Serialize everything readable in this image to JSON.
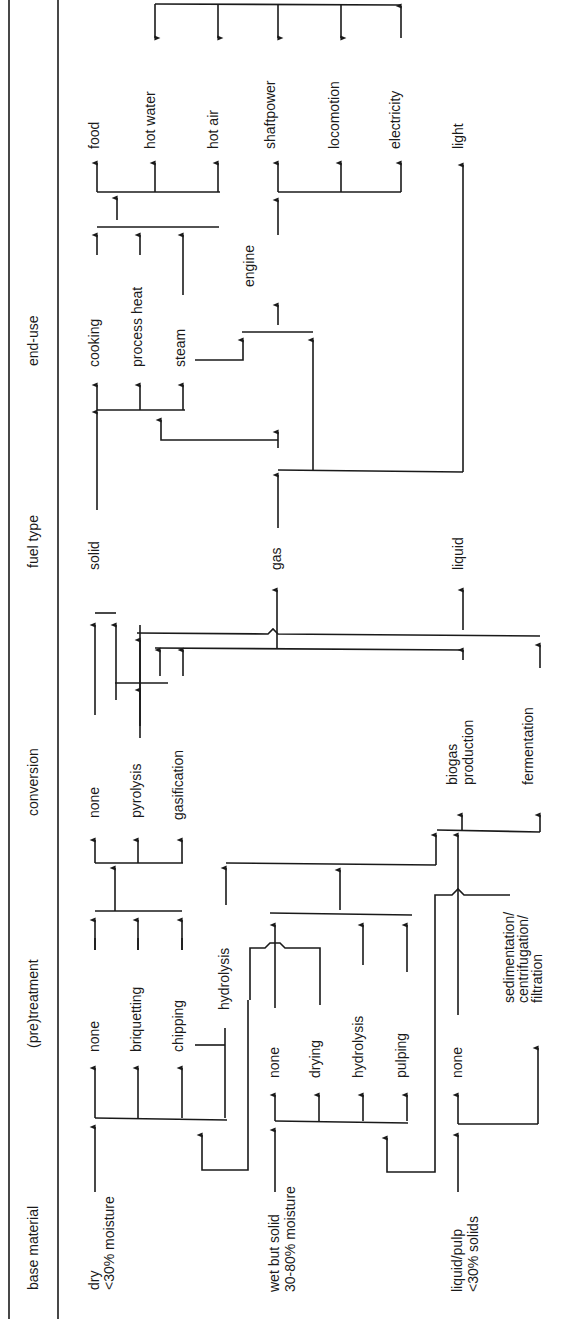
{
  "headers": {
    "base_material": "base material",
    "pretreatment": "(pre)treatment",
    "conversion": "conversion",
    "fuel_type": "fuel type",
    "end_use": "end-use"
  },
  "base_material": {
    "dry": "dry",
    "dry_sub": "<30% moisture",
    "wet": "wet but solid",
    "wet_sub": "30-80% moisture",
    "liquid": "liquid/pulp",
    "liquid_sub": "<30% solids"
  },
  "pretreatment": {
    "none1": "none",
    "briquetting": "briquetting",
    "chipping": "chipping",
    "hydrolysis1": "hydrolysis",
    "none2": "none",
    "drying": "drying",
    "hydrolysis2": "hydrolysis",
    "pulping": "pulping",
    "none3": "none",
    "sed1": "sedimentation/",
    "sed2": "centrifugation/",
    "sed3": "filtration"
  },
  "conversion": {
    "none": "none",
    "pyrolysis": "pyrolysis",
    "gasification": "gasification",
    "biogas1": "biogas",
    "biogas2": "production",
    "fermentation": "fermentation"
  },
  "fuel_type": {
    "solid": "solid",
    "gas": "gas",
    "liquid": "liquid"
  },
  "end_use_intermediate": {
    "cooking": "cooking",
    "process_heat": "process heat",
    "steam": "steam",
    "engine": "engine"
  },
  "end_use": {
    "food": "food",
    "hot_water": "hot water",
    "hot_air": "hot air",
    "shaftpower": "shaftpower",
    "locomotion": "locomotion",
    "electricity": "electricity",
    "light": "light"
  }
}
